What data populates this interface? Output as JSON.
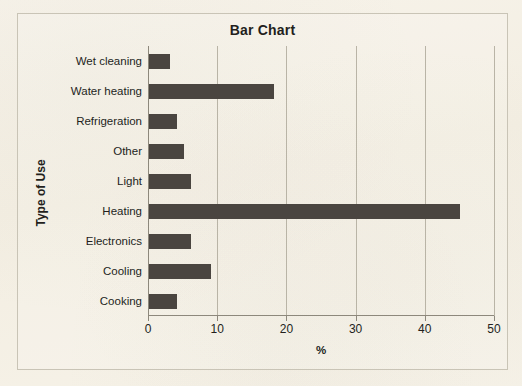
{
  "chart_data": {
    "type": "bar",
    "orientation": "horizontal",
    "title": "Bar Chart",
    "xlabel": "%",
    "ylabel": "Type of Use",
    "xlim": [
      0,
      50
    ],
    "xticks": [
      0,
      10,
      20,
      30,
      40,
      50
    ],
    "xtick_labels": [
      "0",
      "10",
      "20",
      "30",
      "40",
      "50"
    ],
    "grid": "vertical",
    "legend": null,
    "bar_color": "#4a4540",
    "background_color": "#f5f1e6",
    "categories": [
      "Wet cleaning",
      "Water heating",
      "Refrigeration",
      "Other",
      "Light",
      "Heating",
      "Electronics",
      "Cooling",
      "Cooking"
    ],
    "values": [
      3,
      18,
      4,
      5,
      6,
      45,
      6,
      9,
      4
    ]
  }
}
